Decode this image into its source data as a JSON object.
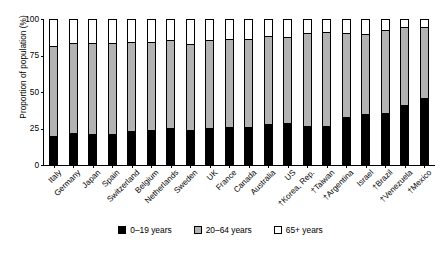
{
  "chart_data": {
    "type": "bar",
    "stacked": true,
    "title": "",
    "xlabel": "",
    "ylabel": "Proportion of population (%)",
    "ylim": [
      0,
      100
    ],
    "yticks": [
      0,
      25,
      50,
      75,
      100
    ],
    "ytick_labels": [
      "0",
      "25",
      "50",
      "75",
      "100"
    ],
    "grid": false,
    "legend_position": "bottom",
    "categories": [
      "Italy",
      "Germany",
      "Japan",
      "Spain",
      "Switzerland",
      "Belgium",
      "Netherlands",
      "Sweden",
      "UK",
      "France",
      "Canada",
      "Australia",
      "US",
      "†Korea, Rep.",
      "†Taiwan",
      "†Argentina",
      "Israel",
      "†Brazil",
      "†Venezuela",
      "†Mexico"
    ],
    "series": [
      {
        "name": "0–19 years",
        "color": "#000000",
        "values": [
          19,
          21,
          20,
          20,
          22,
          23,
          24,
          23,
          24,
          25,
          25,
          27,
          28,
          26,
          26,
          32,
          34,
          35,
          40,
          45
        ]
      },
      {
        "name": "20–64 years",
        "color": "#b3b3b3",
        "values": [
          63,
          63,
          64,
          64,
          63,
          62,
          62,
          60,
          62,
          62,
          62,
          62,
          60,
          65,
          66,
          59,
          56,
          58,
          55,
          50
        ]
      },
      {
        "name": "65+ years",
        "color": "#ffffff",
        "values": [
          18,
          16,
          16,
          16,
          15,
          15,
          14,
          17,
          14,
          13,
          13,
          11,
          12,
          9,
          8,
          9,
          10,
          7,
          5,
          5
        ]
      }
    ],
    "legend": [
      {
        "label": "0–19 years",
        "swatch": "black"
      },
      {
        "label": "20–64 years",
        "swatch": "gray"
      },
      {
        "label": "65+ years",
        "swatch": "white"
      }
    ]
  }
}
